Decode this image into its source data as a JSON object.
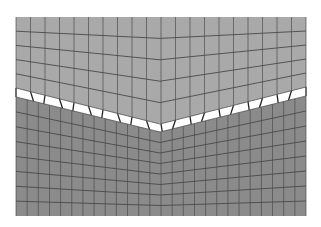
{
  "diagram": {
    "type": "finite-element-mesh",
    "canvas": {
      "width": 321,
      "height": 227,
      "background": "#ffffff"
    },
    "bounds": {
      "left": 16,
      "top": 17,
      "right": 306,
      "bottom": 216
    },
    "apex_x": 160,
    "colors": {
      "upper_region": "#a9a9a9",
      "lower_region": "#8b8b8b",
      "interface_gap": "#ffffff",
      "mesh_line": "#4a4a4a"
    },
    "upper_region": {
      "label": "upper body",
      "columns": 20,
      "rows": 5,
      "top_y": {
        "left": 17,
        "apex": 17,
        "right": 17
      },
      "top_edge_dip": {
        "left": 0,
        "apex": 0,
        "right": 0
      },
      "bottom_y": {
        "left": 88,
        "apex": 124,
        "right": 87
      }
    },
    "interface": {
      "label": "interface gap elements",
      "thickness": 8,
      "element_count": 20
    },
    "lower_region": {
      "label": "lower body",
      "columns": 26,
      "rows": 8,
      "top_y": {
        "left": 97,
        "apex": 132,
        "right": 96
      },
      "bottom_y": {
        "left": 216,
        "apex": 216,
        "right": 216
      }
    }
  }
}
